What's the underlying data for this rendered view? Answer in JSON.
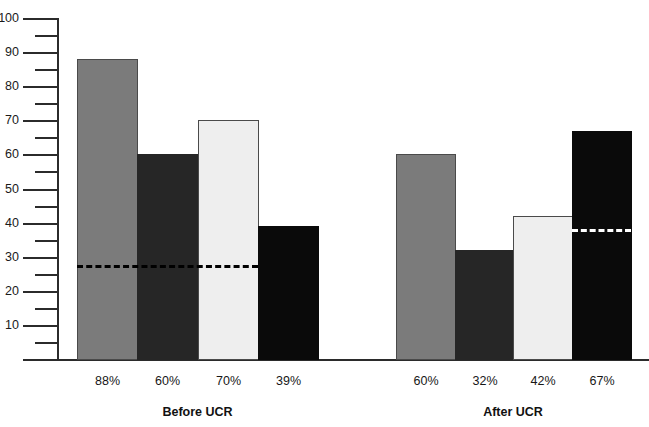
{
  "chart_data": {
    "type": "bar",
    "title": "",
    "subtitle": "",
    "xlabel": "",
    "ylabel": "",
    "ylim": [
      0,
      100
    ],
    "grid": false,
    "legend_position": "none",
    "axis": {
      "major_ticks": [
        0,
        10,
        20,
        30,
        40,
        50,
        60,
        70,
        80,
        90,
        100
      ],
      "major_tick_labels": [
        "",
        "10",
        "20",
        "30",
        "40",
        "50",
        "60",
        "70",
        "80",
        "90",
        "100"
      ],
      "minor_ticks": [
        5,
        15,
        25,
        35,
        45,
        55,
        65,
        75,
        85,
        95
      ]
    },
    "groups": [
      {
        "name": "Before UCR",
        "label": "Before UCR",
        "categories": [
          "88%",
          "60%",
          "70%",
          "39%"
        ],
        "values": [
          88,
          60,
          70,
          39
        ],
        "colors": [
          "#7b7b7b",
          "#262626",
          "#eeeeee",
          "#0a0a0a"
        ],
        "reference_line": {
          "value": 27.5,
          "color": "#000000",
          "style": "dashed",
          "spans_bars": [
            0,
            1,
            2
          ]
        }
      },
      {
        "name": "After UCR",
        "label": "After UCR",
        "categories": [
          "60%",
          "32%",
          "42%",
          "67%"
        ],
        "values": [
          60,
          32,
          42,
          67
        ],
        "colors": [
          "#7b7b7b",
          "#262626",
          "#eeeeee",
          "#0a0a0a"
        ],
        "reference_line": {
          "value": 38,
          "color": "#ffffff",
          "style": "dashed",
          "spans_bars": [
            3
          ]
        }
      }
    ]
  }
}
